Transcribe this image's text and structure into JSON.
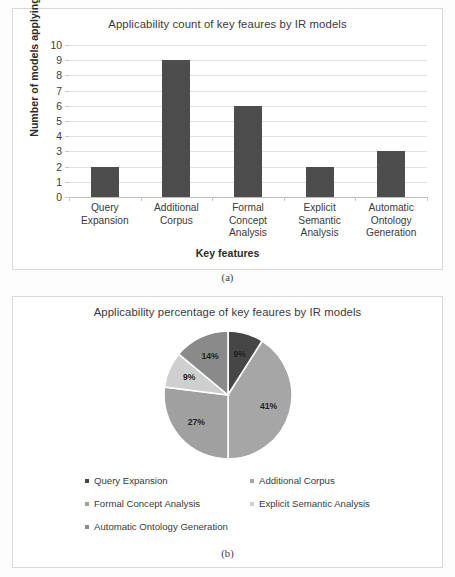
{
  "figure": {
    "caption_a": "(a)",
    "caption_b": "(b)"
  },
  "colors": {
    "bar_fill": "#4d4d4d",
    "gridline": "#e2e2e2",
    "axis": "#bdbdbd",
    "panel_border": "#d9d9d9",
    "background": "#ffffff",
    "text": "#3a3a3a",
    "slice_query_expansion": "#464646",
    "slice_additional_corpus": "#a6a6a6",
    "slice_formal_concept_analysis": "#a0a0a0",
    "slice_explicit_semantic_analysis": "#cfcfcf",
    "slice_automatic_ontology_generation": "#8a8a8a"
  },
  "chart_data": [
    {
      "type": "bar",
      "title": "Applicability  count of key feaures by IR models",
      "xlabel": "Key features",
      "ylabel": "Number of models applying",
      "categories": [
        "Query Expansion",
        "Additional Corpus",
        "Formal Concept Analysis",
        "Explicit Semantic Analysis",
        "Automatic Ontology Generation"
      ],
      "category_lines": [
        [
          "Query",
          "Expansion"
        ],
        [
          "Additional",
          "Corpus"
        ],
        [
          "Formal",
          "Concept",
          "Analysis"
        ],
        [
          "Explicit",
          "Semantic",
          "Analysis"
        ],
        [
          "Automatic",
          "Ontology",
          "Generation"
        ]
      ],
      "values": [
        2,
        9,
        6,
        2,
        3
      ],
      "ylim": [
        0,
        10
      ],
      "yticks": [
        10,
        9,
        8,
        7,
        6,
        5,
        4,
        3,
        2,
        1,
        0
      ],
      "grid": true,
      "legend": "none"
    },
    {
      "type": "pie",
      "title": "Applicability  percentage of key feaures by IR models",
      "labels": [
        "Query Expansion",
        "Additional Corpus",
        "Formal Concept Analysis",
        "Explicit Semantic Analysis",
        "Automatic Ontology Generation"
      ],
      "values": [
        9,
        41,
        27,
        9,
        14
      ],
      "value_labels": [
        "9%",
        "41%",
        "27%",
        "9%",
        "14%"
      ],
      "slice_colors": [
        "#464646",
        "#a6a6a6",
        "#a0a0a0",
        "#cfcfcf",
        "#8a8a8a"
      ],
      "start_angle_deg": 0,
      "direction": "clockwise",
      "legend_position": "bottom",
      "grid": false
    }
  ]
}
